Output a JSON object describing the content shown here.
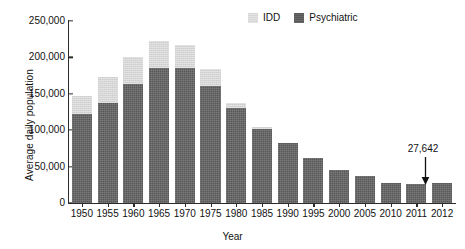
{
  "chart_data": {
    "type": "bar",
    "stacked": true,
    "title": "",
    "xlabel": "Year",
    "ylabel": "Average daily population",
    "categories": [
      "1950",
      "1955",
      "1960",
      "1965",
      "1970",
      "1975",
      "1980",
      "1985",
      "1990",
      "1995",
      "2000",
      "2005",
      "2010",
      "2011",
      "2012"
    ],
    "series": [
      {
        "name": "Psychiatric",
        "color": "#585858",
        "values": [
          122000,
          138000,
          163000,
          186000,
          186000,
          161000,
          130000,
          101000,
          82000,
          62000,
          46000,
          37000,
          28000,
          26500,
          27642
        ]
      },
      {
        "name": "IDD",
        "color": "#d6d6d6",
        "values": [
          25000,
          35000,
          37000,
          36000,
          31000,
          23000,
          8000,
          3000,
          0,
          0,
          0,
          0,
          0,
          0,
          0
        ]
      }
    ],
    "totals": [
      147000,
      173000,
      200000,
      222000,
      217000,
      184000,
      138000,
      104000,
      82000,
      62000,
      46000,
      37000,
      28000,
      26500,
      27642
    ],
    "ylim": [
      0,
      250000
    ],
    "ytick_values": [
      0,
      50000,
      100000,
      150000,
      200000,
      250000
    ],
    "ytick_labels": [
      "0",
      "50,000",
      "100,000",
      "150,000",
      "200,000",
      "250,000"
    ],
    "grid": false,
    "legend_position": "top-right",
    "annotations": [
      {
        "text": "27,642",
        "points_to_category": "2012",
        "arrow": "down"
      }
    ]
  },
  "legend": {
    "items": [
      {
        "label": "IDD",
        "swatch": "idd-swatch"
      },
      {
        "label": "Psychiatric",
        "swatch": "psychiatric-swatch"
      }
    ]
  },
  "axes": {
    "y_title": "Average daily population",
    "x_title": "Year"
  }
}
